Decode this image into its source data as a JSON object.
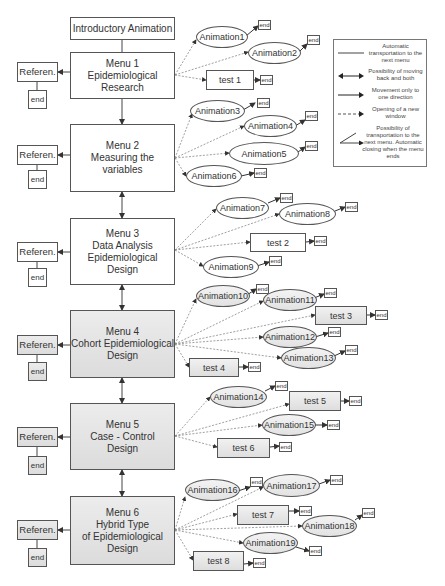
{
  "intro": {
    "label": "Introductory Animation"
  },
  "menus": [
    {
      "label": "Menu 1\nEpidemiological\nResearch",
      "ref": "Referen.",
      "end": "end"
    },
    {
      "label": "Menu 2\nMeasuring the variables",
      "ref": "Referen.",
      "end": "end"
    },
    {
      "label": "Menu 3\nData Analysis\nEpidemiological Design",
      "ref": "Referen.",
      "end": "end"
    },
    {
      "label": "Menu 4\nCohort Epidemiological\nDesign",
      "ref": "Referen.",
      "end": "end"
    },
    {
      "label": "Menu 5\nCase - Control\nDesign",
      "ref": "Referen.",
      "end": "end"
    },
    {
      "label": "Menu 6\nHybrid Type\nof Epidemiological\nDesign",
      "ref": "Referen.",
      "end": "end"
    }
  ],
  "nodes": {
    "animation1": "Animation1",
    "animation2": "Animation2",
    "test1": "test 1",
    "animation3": "Animation3",
    "animation4": "Animation4",
    "animation5": "Animation5",
    "animation6": "Animation6",
    "animation7": "Animation7",
    "animation8": "Animation8",
    "test2": "test 2",
    "animation9": "Animation9",
    "animation10": "Animation10",
    "animation11": "Animation11",
    "test3": "test 3",
    "animation12": "Animation12",
    "animation13": "Animation13",
    "test4": "test 4",
    "animation14": "Animation14",
    "test5": "test 5",
    "animation15": "Animation15",
    "test6": "test 6",
    "animation16": "Animation16",
    "animation17": "Animation17",
    "test7": "test 7",
    "animation18": "Animation18",
    "animation19": "Animation19",
    "test8": "test 8",
    "end": "end"
  },
  "legend": {
    "items": [
      {
        "icon": "solid-line",
        "text": "Automatic transportation to the next menu"
      },
      {
        "icon": "double-arrow",
        "text": "Possibility of moving back and both"
      },
      {
        "icon": "single-arrow",
        "text": "Movement only to one direction"
      },
      {
        "icon": "dashed-arrow",
        "text": "Opening of a new window"
      },
      {
        "icon": "angled-arrow",
        "text": "Possibility of transportation to the next menu. Automatic closing when the menu ends"
      }
    ]
  },
  "colors": {
    "line": "#555555",
    "shade": "#e0e0e0",
    "dotted": "#888888"
  }
}
